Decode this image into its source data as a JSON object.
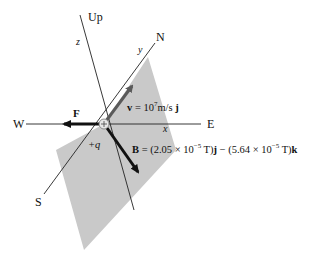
{
  "compass": {
    "up": "Up",
    "north": "N",
    "east": "E",
    "south": "S",
    "west": "W"
  },
  "axes": {
    "x": "x",
    "y": "y",
    "z": "z"
  },
  "charge": {
    "label": "+q"
  },
  "force": {
    "symbol": "F"
  },
  "velocity": {
    "symbol": "v",
    "eq": " = 10",
    "exp": "7",
    "unit": "m/s ",
    "dir": "j"
  },
  "field": {
    "symbol": "B",
    "eq": " = (2.05 × 10",
    "exp1": "−5",
    "mid": " T)",
    "dir1": "j",
    "minus": " − (5.64 × 10",
    "exp2": "−5",
    "end": " T)",
    "dir2": "k"
  },
  "colors": {
    "plane": "#c8c8c8",
    "line": "#222222",
    "velocity_arrow": "#5a5a5a",
    "force_arrow": "#111111",
    "field_arrow": "#111111"
  }
}
